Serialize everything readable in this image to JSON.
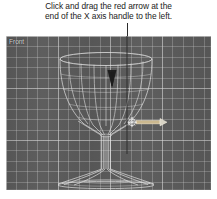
{
  "caption": {
    "line1": "Click and drag the red arrow at the",
    "line2": "end of the X axis handle to the left."
  },
  "viewport": {
    "label": "Front",
    "background_color": "#5b5b5b",
    "grid_color": "#d2d2d2",
    "wireframe_color": "#e8e8e8"
  },
  "model": {
    "name": "wineglass",
    "parts": {
      "bowl": "bowl",
      "stem": "stem",
      "base": "base"
    }
  },
  "gizmo": {
    "name": "move-transform-gizmo",
    "x_axis_handle_label": "X",
    "x_axis_color": "#c8b48a",
    "center_color": "#f2f2f2"
  },
  "annotation": {
    "leader_color": "#2b2b2b",
    "arrow_direction": "down"
  }
}
